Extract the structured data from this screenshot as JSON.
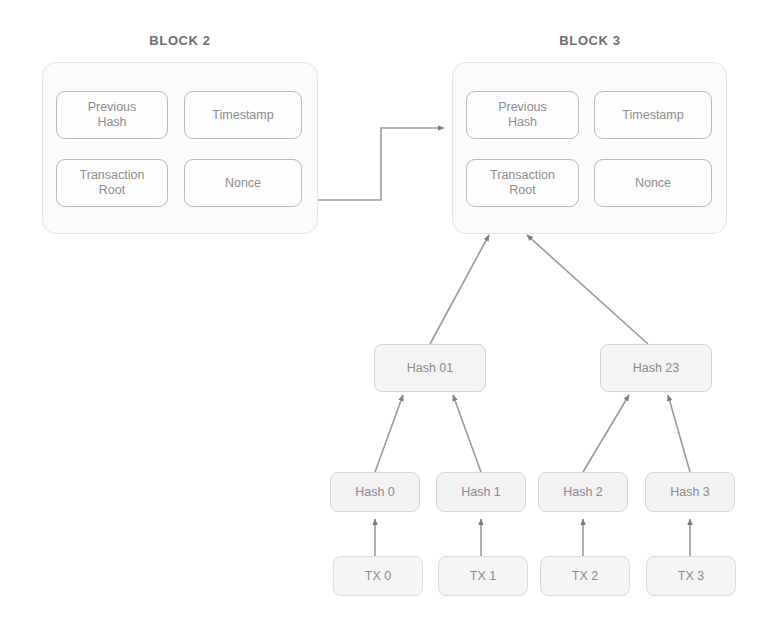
{
  "diagram": {
    "title_block2": "BLOCK 2",
    "title_block3": "BLOCK 3",
    "stroke_color": "#9a9a9a",
    "panel_fill": "#fbfbfb",
    "node_fill": "#f4f4f4",
    "text_color": "#8a8a8a"
  },
  "block2": {
    "label": "BLOCK 2",
    "fields": [
      {
        "id": "previous-hash",
        "label": "Previous\nHash"
      },
      {
        "id": "timestamp",
        "label": "Timestamp"
      },
      {
        "id": "transaction-root",
        "label": "Transaction\nRoot"
      },
      {
        "id": "nonce",
        "label": "Nonce"
      }
    ]
  },
  "block3": {
    "label": "BLOCK 3",
    "fields": [
      {
        "id": "previous-hash",
        "label": "Previous\nHash"
      },
      {
        "id": "timestamp",
        "label": "Timestamp"
      },
      {
        "id": "transaction-root",
        "label": "Transaction\nRoot"
      },
      {
        "id": "nonce",
        "label": "Nonce"
      }
    ]
  },
  "merkle": {
    "branch_nodes": [
      {
        "id": "hash-01",
        "label": "Hash 01"
      },
      {
        "id": "hash-23",
        "label": "Hash 23"
      }
    ],
    "leaf_hashes": [
      {
        "id": "hash-0",
        "label": "Hash 0"
      },
      {
        "id": "hash-1",
        "label": "Hash 1"
      },
      {
        "id": "hash-2",
        "label": "Hash 2"
      },
      {
        "id": "hash-3",
        "label": "Hash 3"
      }
    ],
    "transactions": [
      {
        "id": "tx-0",
        "label": "TX 0"
      },
      {
        "id": "tx-1",
        "label": "TX 1"
      },
      {
        "id": "tx-2",
        "label": "TX 2"
      },
      {
        "id": "tx-3",
        "label": "TX 3"
      }
    ]
  }
}
